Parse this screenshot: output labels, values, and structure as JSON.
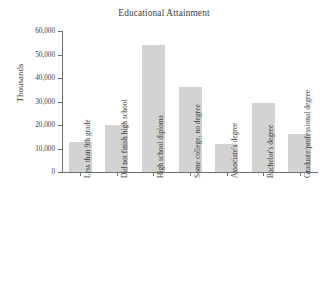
{
  "chart_data": {
    "type": "bar",
    "title": "Educational Attainment",
    "xlabel": "",
    "ylabel": "Thousands",
    "categories": [
      "Less than 9th grade",
      "Did not finish high school",
      "High school diploma",
      "Some college, no degree",
      "Associate's degree",
      "Bachelor's degree",
      "Graduate/professional degree"
    ],
    "values": [
      12700,
      20000,
      54000,
      36000,
      12000,
      29500,
      16200
    ],
    "ylim": [
      0,
      60000
    ],
    "ytick_values": [
      0,
      10000,
      20000,
      30000,
      40000,
      50000,
      60000
    ],
    "ytick_labels": [
      "0",
      "10,000",
      "20,000",
      "30,000",
      "40,000",
      "50,000",
      "60,000"
    ],
    "grid": false,
    "legend": false,
    "bar_color": "#d3d3d3",
    "axis_color": "#6f6f6f",
    "text_color": "#3d3d3d",
    "background": "#ffffff"
  }
}
